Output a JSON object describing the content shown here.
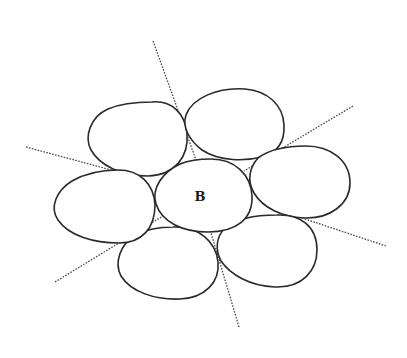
{
  "diagram": {
    "type": "packing-illustration",
    "center_label": "B",
    "colors": {
      "outline": "#2a2a2a",
      "separator": "#4a4a4a",
      "fill": "#ffffff"
    },
    "cells": [
      {
        "id": "center",
        "label": "B"
      },
      {
        "id": "upper-left"
      },
      {
        "id": "upper-right"
      },
      {
        "id": "right"
      },
      {
        "id": "lower-right"
      },
      {
        "id": "lower-left"
      },
      {
        "id": "left"
      }
    ],
    "separators": [
      {
        "id": "sep-top",
        "from": [
          153,
          41
        ],
        "to": [
          196,
          158
        ]
      },
      {
        "id": "sep-upper-right",
        "from": [
          353,
          106
        ],
        "to": [
          248,
          168
        ]
      },
      {
        "id": "sep-left",
        "from": [
          26,
          147
        ],
        "to": [
          112,
          170
        ]
      },
      {
        "id": "sep-right",
        "from": [
          386,
          246
        ],
        "to": [
          276,
          209
        ]
      },
      {
        "id": "sep-lower-left",
        "from": [
          55,
          282
        ],
        "to": [
          160,
          218
        ]
      },
      {
        "id": "sep-bottom",
        "from": [
          239,
          327
        ],
        "to": [
          210,
          228
        ]
      }
    ]
  }
}
